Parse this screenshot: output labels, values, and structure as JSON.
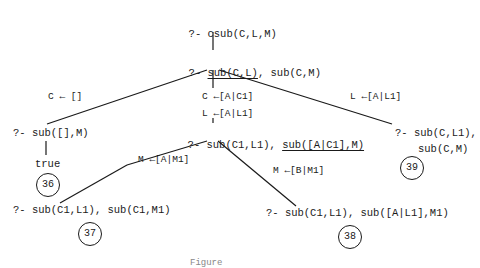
{
  "diagram": {
    "type": "prolog-search-tree",
    "root": {
      "prefix": "?- ",
      "goal": "csub(C,L,M)"
    },
    "level1": {
      "prefix": "?- ",
      "selected_goal": "sub(C,L)",
      "rest": ", sub(C,M)"
    },
    "branches": {
      "left": {
        "binding": "C ← []",
        "node": "?- sub([],M)",
        "result": "true",
        "number": "36"
      },
      "middle": {
        "binding1": "C ←[A|C1]",
        "binding2": "L ←[A|L1]",
        "node_prefix": "?- sub(C1,L1), ",
        "node_selected": "sub([A|C1],M)",
        "children": {
          "left": {
            "binding": "M ←[A|M1]",
            "node": "?- sub(C1,L1), sub(C1,M1)",
            "number": "37"
          },
          "right": {
            "binding": "M ←[B|M1]",
            "node": "?- sub(C1,L1), sub([A|L1],M1)",
            "number": "38"
          }
        }
      },
      "right": {
        "binding": "L ←[A|L1]",
        "node_line1": "?- sub(C,L1),",
        "node_line2": "sub(C,M)",
        "number": "39"
      }
    },
    "caption": "Figure"
  }
}
